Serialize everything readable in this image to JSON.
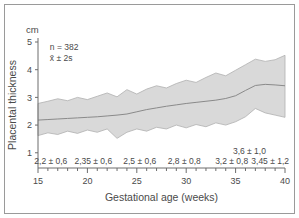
{
  "figure": {
    "unit_label": "cm",
    "annotation_n": "n = 382",
    "annotation_sd": "x̄ ± 2s",
    "highlight_label": "3,6 ± 1,0"
  },
  "colors": {
    "band_fill": "#d9d9d9",
    "band_edge": "#b0b0b0",
    "mean_line": "#8a8a8a",
    "axis": "#6d6d6d",
    "text": "#4a4a4a",
    "frame": "#9a9a9a",
    "background": "#ffffff"
  },
  "chart_data": {
    "type": "area",
    "title": "",
    "xlabel": "Gestational age (weeks)",
    "ylabel": "Placental thickness",
    "yunit": "cm",
    "xlim": [
      15,
      40
    ],
    "ylim": [
      0.45,
      5.0
    ],
    "xticks": [
      15,
      20,
      25,
      30,
      35,
      40
    ],
    "xtick_labels": [
      "15",
      "20",
      "25",
      "30",
      "35",
      "40"
    ],
    "xminor_step": 1,
    "yticks": [
      1,
      2,
      3,
      4,
      5
    ],
    "ytick_labels": [
      "1",
      "2",
      "3",
      "4",
      "5"
    ],
    "grid": false,
    "legend": false,
    "x": [
      15,
      16,
      17,
      18,
      19,
      20,
      21,
      22,
      23,
      24,
      25,
      26,
      27,
      28,
      29,
      30,
      31,
      32,
      33,
      34,
      35,
      36,
      37,
      38,
      39,
      40
    ],
    "series": [
      {
        "name": "mean",
        "values": [
          2.18,
          2.2,
          2.22,
          2.24,
          2.26,
          2.28,
          2.3,
          2.33,
          2.36,
          2.4,
          2.48,
          2.56,
          2.62,
          2.68,
          2.73,
          2.78,
          2.82,
          2.86,
          2.9,
          2.96,
          3.06,
          3.25,
          3.43,
          3.47,
          3.45,
          3.42
        ]
      },
      {
        "name": "upper_2s",
        "values": [
          2.78,
          2.86,
          2.95,
          2.88,
          3.0,
          2.92,
          3.04,
          3.16,
          3.02,
          3.28,
          3.12,
          3.3,
          3.42,
          3.34,
          3.5,
          3.62,
          3.54,
          3.72,
          3.88,
          3.78,
          3.98,
          4.18,
          4.38,
          4.3,
          4.36,
          4.52
        ]
      },
      {
        "name": "lower_2s",
        "values": [
          1.62,
          1.72,
          1.66,
          1.78,
          1.7,
          1.82,
          1.74,
          1.86,
          1.52,
          1.74,
          1.86,
          1.78,
          1.92,
          1.86,
          2.0,
          1.9,
          2.02,
          1.94,
          2.08,
          2.0,
          2.12,
          2.3,
          2.6,
          2.44,
          2.36,
          2.28
        ]
      }
    ],
    "annotations": [
      {
        "text": "n = 382",
        "x": 16.2,
        "y": 4.72
      },
      {
        "text": "x̄ ± 2s",
        "x": 16.2,
        "y": 4.32
      },
      {
        "text": "3,6 ± 1,0",
        "x": 36.4,
        "y": 0.95
      }
    ],
    "interval_labels": [
      {
        "text": "2,2 ± 0,6",
        "x": 16.3
      },
      {
        "text": "2,35 ± 0,6",
        "x": 20.6
      },
      {
        "text": "2,5 ± 0,6",
        "x": 25.3
      },
      {
        "text": "2,8 ± 0,8",
        "x": 29.8
      },
      {
        "text": "3,2 ± 0,8",
        "x": 34.6
      },
      {
        "text": "3,45 ± 1,2",
        "x": 38.5
      }
    ]
  }
}
